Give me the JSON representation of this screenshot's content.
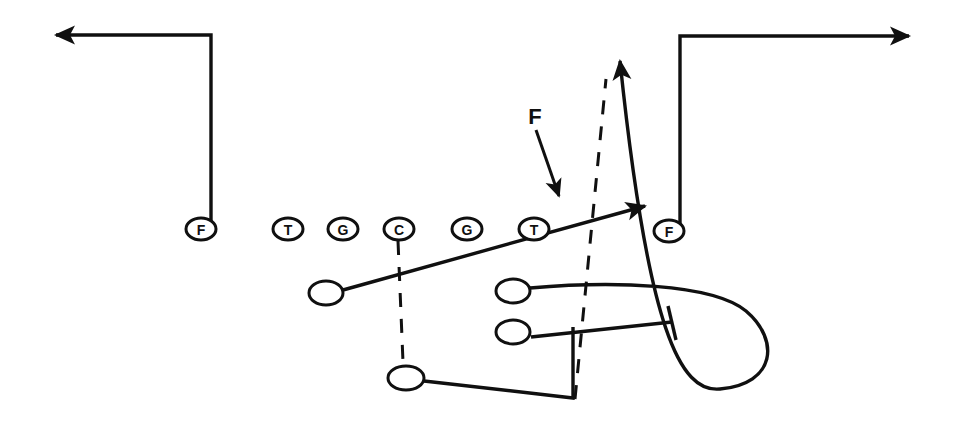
{
  "diagram": {
    "colors": {
      "ink": "#101010",
      "background": "#ffffff"
    },
    "stroke": {
      "route_width": 3.4,
      "player_width": 3.0,
      "dashed_width": 3.0,
      "dash_pattern": "14 12"
    },
    "linemen": [
      {
        "name": "left-end",
        "label": "F",
        "cx": 201,
        "cy": 229,
        "rx": 15,
        "ry": 11,
        "shape": "ellipse"
      },
      {
        "name": "left-tackle",
        "label": "T",
        "cx": 288,
        "cy": 229,
        "rx": 15,
        "ry": 11,
        "shape": "ellipse"
      },
      {
        "name": "left-guard",
        "label": "G",
        "cx": 343,
        "cy": 229,
        "rx": 15,
        "ry": 11,
        "shape": "ellipse"
      },
      {
        "name": "center",
        "label": "C",
        "cx": 399,
        "cy": 229,
        "rx": 15,
        "ry": 11,
        "shape": "ellipse"
      },
      {
        "name": "right-guard",
        "label": "G",
        "cx": 467,
        "cy": 229,
        "rx": 15,
        "ry": 11,
        "shape": "ellipse"
      },
      {
        "name": "right-tackle",
        "label": "T",
        "cx": 534,
        "cy": 229,
        "rx": 15,
        "ry": 11,
        "shape": "ellipse"
      },
      {
        "name": "right-end",
        "label": "F",
        "cx": 669,
        "cy": 231,
        "rx": 15,
        "ry": 11,
        "shape": "ellipse"
      }
    ],
    "backs": [
      {
        "name": "left-back",
        "cx": 326,
        "cy": 293,
        "rx": 17,
        "ry": 12
      },
      {
        "name": "right-upper-back",
        "cx": 513,
        "cy": 291,
        "rx": 17,
        "ry": 12
      },
      {
        "name": "right-lower-back",
        "cx": 513,
        "cy": 332,
        "rx": 17,
        "ry": 12
      },
      {
        "name": "deep-back",
        "cx": 406,
        "cy": 378,
        "rx": 18,
        "ry": 12
      }
    ],
    "annotation": {
      "label": "F",
      "label_x": 535,
      "label_y": 116,
      "pointer_from_x": 536,
      "pointer_from_y": 130,
      "pointer_to_x": 559,
      "pointer_to_y": 196
    },
    "routes": [
      {
        "name": "left-end-route",
        "kind": "route",
        "path": "M 211 228 L 211 35 L 56 35",
        "arrow": true
      },
      {
        "name": "right-end-route",
        "kind": "route",
        "path": "M 680 230 L 680 36 L 909 36",
        "arrow": true
      },
      {
        "name": "left-back-diagonal-route",
        "kind": "route",
        "path": "M 343 290 L 645 206",
        "arrow": true
      },
      {
        "name": "right-upper-back-loop-route",
        "kind": "route",
        "path": "M 530 288 C 610 281 712 283 746 311 C 780 340 776 384 720 389 C 680 393 648 330 620 61",
        "arrow": true
      },
      {
        "name": "right-lower-back-block-route",
        "kind": "block",
        "path": "M 531 337 L 672 322",
        "block_mark": "M 668 306 L 676 340"
      },
      {
        "name": "deep-back-route",
        "kind": "route",
        "path": "M 424 381 L 573 398 L 573 327",
        "arrow": false
      }
    ],
    "dashed_lines": [
      {
        "name": "center-to-deep-back-dashed",
        "path": "M 398 241 L 403 362"
      },
      {
        "name": "snap-motion-dashed",
        "path": "M 575 399 L 606 79"
      }
    ]
  }
}
